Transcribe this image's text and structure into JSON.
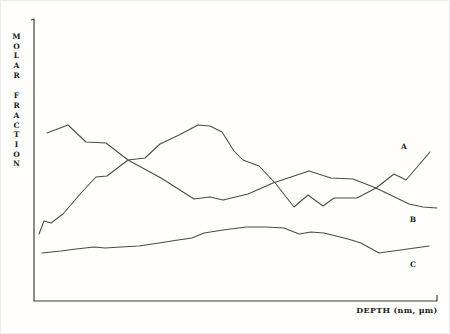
{
  "figure": {
    "background": "#fffefd",
    "line_color": "#4a4a4a",
    "text_color": "#222222"
  },
  "chart_data": {
    "type": "line",
    "title": "",
    "xlabel": "DEPTH (nm, μm)",
    "ylabel": "MOLAR FRACTION",
    "grid": false,
    "legend": "letter labels placed at right ends of curves",
    "x_axis": {
      "labeled_ticks": false,
      "units_shown": "nm, μm",
      "end_tick": true
    },
    "y_axis": {
      "labeled_ticks": false,
      "units_shown": "molar fraction (arbitrary)",
      "end_tick": true
    },
    "units_note": "axes carry no numeric scale; point coordinates below are figure pixel coordinates (450x334), y increases downward",
    "axis_path_px": [
      [
        30,
        19
      ],
      [
        33,
        18
      ],
      [
        33,
        300
      ],
      [
        436,
        300
      ],
      [
        436,
        294
      ]
    ],
    "series": [
      {
        "name": "A",
        "label": "A",
        "label_baseline_px": [
          403,
          148
        ],
        "points_px": [
          [
            38,
            233
          ],
          [
            43,
            220
          ],
          [
            50,
            222
          ],
          [
            62,
            213
          ],
          [
            80,
            192
          ],
          [
            95,
            176
          ],
          [
            106,
            175
          ],
          [
            127,
            159
          ],
          [
            144,
            157
          ],
          [
            159,
            143
          ],
          [
            178,
            134
          ],
          [
            197,
            124
          ],
          [
            209,
            125
          ],
          [
            221,
            131
          ],
          [
            233,
            150
          ],
          [
            242,
            159
          ],
          [
            258,
            165
          ],
          [
            275,
            183
          ],
          [
            293,
            206
          ],
          [
            307,
            194
          ],
          [
            322,
            205
          ],
          [
            333,
            197
          ],
          [
            356,
            197
          ],
          [
            375,
            187
          ],
          [
            393,
            173
          ],
          [
            405,
            179
          ],
          [
            429,
            151
          ]
        ]
      },
      {
        "name": "B",
        "label": "B",
        "label_baseline_px": [
          412,
          221
        ],
        "points_px": [
          [
            46,
            132
          ],
          [
            67,
            124
          ],
          [
            85,
            141
          ],
          [
            105,
            142
          ],
          [
            127,
            159
          ],
          [
            160,
            177
          ],
          [
            193,
            198
          ],
          [
            209,
            196
          ],
          [
            222,
            199
          ],
          [
            247,
            193
          ],
          [
            272,
            182
          ],
          [
            308,
            170
          ],
          [
            330,
            177
          ],
          [
            352,
            178
          ],
          [
            375,
            187
          ],
          [
            408,
            203
          ],
          [
            422,
            206
          ],
          [
            436,
            207
          ]
        ]
      },
      {
        "name": "C",
        "label": "C",
        "label_baseline_px": [
          412,
          266
        ],
        "points_px": [
          [
            41,
            252
          ],
          [
            60,
            250
          ],
          [
            75,
            248
          ],
          [
            93,
            246
          ],
          [
            104,
            247
          ],
          [
            120,
            246
          ],
          [
            138,
            245
          ],
          [
            158,
            242
          ],
          [
            177,
            239
          ],
          [
            191,
            237
          ],
          [
            203,
            232
          ],
          [
            222,
            229
          ],
          [
            245,
            226
          ],
          [
            265,
            226
          ],
          [
            283,
            227
          ],
          [
            298,
            233
          ],
          [
            310,
            231
          ],
          [
            323,
            232
          ],
          [
            347,
            238
          ],
          [
            360,
            242
          ],
          [
            378,
            252
          ],
          [
            428,
            245
          ]
        ]
      }
    ]
  }
}
